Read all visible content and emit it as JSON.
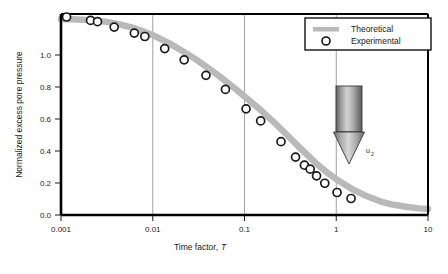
{
  "chart_data": {
    "type": "line",
    "title": "",
    "xlabel": "Time factor, T",
    "xlabel_plain": "Time factor,",
    "xlabel_italic": "T",
    "ylabel": "Normalized excess pore pressure",
    "xscale": "log",
    "xlim": [
      0.001,
      10
    ],
    "ylim": [
      0.0,
      1.0
    ],
    "grid": "vertical-major",
    "xticks": [
      0.001,
      0.01,
      0.1,
      1,
      10
    ],
    "xtick_labels": [
      "0.001",
      "0.01",
      "0.1",
      "1",
      "10"
    ],
    "yticks": [
      0.0,
      0.2,
      0.4,
      0.6,
      0.8,
      1.0
    ],
    "ytick_labels": [
      "0.0",
      "0.2",
      "0.4",
      "0.6",
      "0.8",
      "1.0"
    ],
    "legend_position": "top-right",
    "series": [
      {
        "name": "Theoretical",
        "style": "thick-band",
        "color": "#b9b9b9",
        "x": [
          0.001,
          0.0015,
          0.002,
          0.003,
          0.004,
          0.006,
          0.008,
          0.01,
          0.015,
          0.02,
          0.03,
          0.04,
          0.06,
          0.08,
          0.1,
          0.15,
          0.2,
          0.3,
          0.4,
          0.6,
          0.8,
          1.0,
          1.5,
          2.0,
          3.0,
          4.0,
          6.0,
          8.0,
          10.0
        ],
        "values": [
          0.975,
          0.973,
          0.97,
          0.962,
          0.952,
          0.932,
          0.912,
          0.895,
          0.855,
          0.822,
          0.772,
          0.732,
          0.672,
          0.627,
          0.59,
          0.522,
          0.47,
          0.392,
          0.335,
          0.258,
          0.21,
          0.178,
          0.128,
          0.1,
          0.068,
          0.053,
          0.04,
          0.033,
          0.03
        ]
      },
      {
        "name": "Experimental",
        "style": "open-circle",
        "color": "#1a1a1a",
        "x": [
          0.00115,
          0.0021,
          0.0025,
          0.0038,
          0.0063,
          0.0082,
          0.0135,
          0.022,
          0.038,
          0.062,
          0.104,
          0.15,
          0.25,
          0.36,
          0.45,
          0.52,
          0.61,
          0.75,
          1.02,
          1.45
        ],
        "values": [
          0.985,
          0.968,
          0.962,
          0.935,
          0.905,
          0.888,
          0.828,
          0.772,
          0.695,
          0.625,
          0.528,
          0.468,
          0.365,
          0.288,
          0.248,
          0.228,
          0.195,
          0.158,
          0.112,
          0.082
        ]
      }
    ]
  },
  "legend": {
    "items": [
      {
        "label": "Theoretical",
        "marker": "band-swatch",
        "color": "#b9b9b9"
      },
      {
        "label": "Experimental",
        "marker": "open-circle",
        "color": "#1a1a1a"
      }
    ]
  },
  "inset": {
    "name": "cpt-cone-penetrometer",
    "label": "u",
    "label_subscript": "2"
  }
}
